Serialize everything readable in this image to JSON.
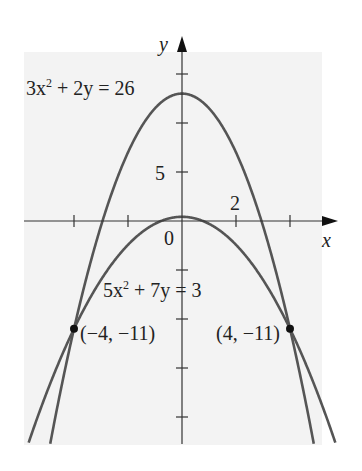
{
  "chart_data": {
    "type": "line",
    "title": "",
    "xlabel": "x",
    "ylabel": "y",
    "xlim": [
      -6.6,
      5.8
    ],
    "ylim": [
      -22.7,
      17.4
    ],
    "grid": false,
    "x_ticks": [
      -4,
      -2,
      0,
      2,
      4
    ],
    "y_ticks": [
      -20,
      -15,
      -10,
      -5,
      5,
      10,
      15
    ],
    "tick_labels": {
      "x": [
        "2"
      ],
      "y": [
        "5"
      ],
      "origin": "0"
    },
    "series": [
      {
        "name": "3x² + 2y = 26",
        "equation": "y = 13 - 1.5x^2",
        "vertex": [
          0,
          13
        ],
        "color": "#555555"
      },
      {
        "name": "5x² + 7y = 3",
        "equation": "y = (3 - 5x^2)/7",
        "vertex": [
          0,
          0.4286
        ],
        "color": "#555555"
      }
    ],
    "points": [
      {
        "label": "(−4, −11)",
        "x": -4,
        "y": -11
      },
      {
        "label": "(4, −11)",
        "x": 4,
        "y": -11
      }
    ],
    "annotations": [
      {
        "text": "3x² + 2y = 26",
        "near": "top-left"
      },
      {
        "text": "5x² + 7y = 3",
        "near": "center"
      }
    ]
  },
  "labels": {
    "eq1_coef": "3x",
    "eq1_exp": "2",
    "eq1_rest": " + 2y = 26",
    "eq2_coef": "5x",
    "eq2_exp": "2",
    "eq2_rest": " + 7y = 3",
    "pt_left": "(−4, −11)",
    "pt_right": "(4, −11)",
    "x_axis": "x",
    "y_axis": "y",
    "tick_5": "5",
    "tick_2": "2",
    "origin": "0"
  },
  "colors": {
    "background": "#f3f3f3",
    "curve": "#555555",
    "axis": "#333333",
    "point": "#111111"
  }
}
